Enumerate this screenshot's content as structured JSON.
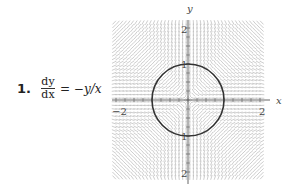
{
  "problem": {
    "number": "1.",
    "lhs_numerator": "dy",
    "lhs_denominator": "dx",
    "rhs": "= −y/x"
  },
  "chart_data": {
    "type": "slope_field",
    "equation": "dy/dx = -y/x",
    "xlabel": "x",
    "ylabel": "y",
    "xlim": [
      -2,
      2
    ],
    "ylim": [
      -2,
      2
    ],
    "x_ticks": [
      {
        "value": -2,
        "label": "−2"
      },
      {
        "value": 2,
        "label": "2"
      }
    ],
    "y_ticks": [
      {
        "value": 2,
        "label": "2"
      },
      {
        "value": 1,
        "label": "1"
      },
      {
        "value": -1,
        "label": "1"
      },
      {
        "value": -2,
        "label": "2"
      }
    ],
    "grid": false,
    "overlays": [
      {
        "type": "circle",
        "center": [
          0,
          0
        ],
        "radius": 1,
        "description": "solid dark circle of radius 1 drawn over the slope field"
      }
    ],
    "field_resolution": {
      "dx": 0.1,
      "dy": 0.1
    },
    "colors": {
      "field": "#b8b8b8",
      "circle": "#333333",
      "axes": "#666666"
    }
  },
  "axes_labels": {
    "x": "x",
    "y": "y",
    "x_min": "−2",
    "x_max": "2",
    "y_max": "2",
    "y_min": "2",
    "y_one_top": "1",
    "y_one_bottom": "1"
  }
}
